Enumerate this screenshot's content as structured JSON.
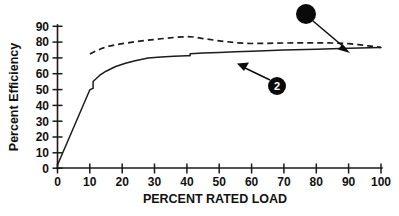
{
  "chart_data": {
    "type": "line",
    "title": "",
    "xlabel": "PERCENT RATED LOAD",
    "ylabel": "Percent Efficiency",
    "xlim": [
      0,
      100
    ],
    "ylim": [
      0,
      90
    ],
    "xticks": [
      0,
      10,
      20,
      30,
      40,
      50,
      60,
      70,
      80,
      90,
      100
    ],
    "yticks": [
      0,
      10,
      20,
      30,
      40,
      50,
      60,
      70,
      80,
      90
    ],
    "xtick_labels": [
      "0",
      "10",
      "20",
      "30",
      "40",
      "50",
      "60",
      "70",
      "80",
      "90",
      "100"
    ],
    "ytick_labels": [
      "0",
      "10",
      "20",
      "30",
      "40",
      "50",
      "60",
      "70",
      "80",
      "90"
    ],
    "grid": false,
    "legend": "none",
    "series": [
      {
        "name": "Curve 1 (dashed)",
        "style": "dashed",
        "color": "#1c1c1c",
        "x": [
          10,
          12,
          14,
          16,
          18,
          20,
          24,
          28,
          32,
          36,
          40,
          42,
          45,
          50,
          55,
          60,
          65,
          70,
          75,
          80,
          85,
          90,
          93,
          96,
          100
        ],
        "values": [
          72.5,
          74.5,
          76.2,
          77.4,
          78.3,
          79.0,
          80.2,
          81.2,
          82.1,
          82.9,
          83.5,
          83.2,
          82.2,
          80.8,
          79.6,
          79.1,
          79.2,
          79.4,
          79.5,
          79.5,
          79.4,
          79.0,
          78.4,
          77.6,
          76.6
        ]
      },
      {
        "name": "Curve 2 (solid)",
        "style": "solid",
        "color": "#1c1c1c",
        "x": [
          0,
          10,
          11,
          11,
          13,
          15,
          18,
          21,
          24,
          28,
          32,
          36,
          40,
          41,
          41,
          45,
          50,
          55,
          60,
          70,
          80,
          90,
          100
        ],
        "values": [
          2.0,
          49.8,
          50.6,
          55.0,
          58.8,
          61.5,
          64.5,
          66.6,
          68.2,
          69.9,
          70.6,
          71.0,
          71.3,
          71.4,
          72.6,
          73.0,
          73.4,
          73.8,
          74.2,
          74.9,
          75.5,
          76.1,
          76.6
        ]
      }
    ],
    "annotations": [
      {
        "label": "",
        "marker": "filled-circle",
        "marker_center": [
          306,
          14
        ],
        "marker_radius": 10,
        "points_to": [
          348,
          52
        ],
        "target_series": "Curve 1 (dashed)"
      },
      {
        "label": "2",
        "marker": "numbered-circle",
        "marker_center": [
          277,
          86
        ],
        "marker_radius": 9,
        "points_to": [
          238,
          63
        ],
        "target_series": "Curve 2 (solid)"
      }
    ]
  }
}
